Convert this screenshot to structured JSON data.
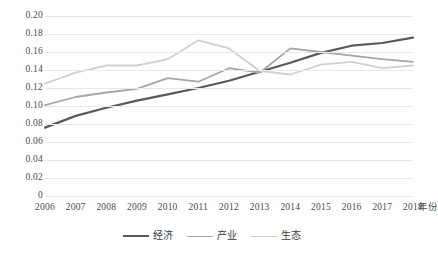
{
  "chart_data": {
    "type": "line",
    "title": "",
    "xlabel": "年份",
    "ylabel": "",
    "categories": [
      "2006",
      "2007",
      "2008",
      "2009",
      "2010",
      "2011",
      "2012",
      "2013",
      "2014",
      "2015",
      "2016",
      "2017",
      "2018"
    ],
    "ylim": [
      0,
      0.2
    ],
    "ytick_labels": [
      "0.20",
      "0.18",
      "0.16",
      "0.14",
      "0.12",
      "0.10",
      "0.08",
      "0.06",
      "0.04",
      "0.02",
      "0"
    ],
    "ytick_values": [
      0.2,
      0.18,
      0.16,
      0.14,
      0.12,
      0.1,
      0.08,
      0.06,
      0.04,
      0.02,
      0
    ],
    "grid": true,
    "legend_position": "bottom",
    "series": [
      {
        "name": "经济",
        "color": "#595959",
        "width": 2.2,
        "values": [
          0.076,
          0.089,
          0.098,
          0.106,
          0.113,
          0.12,
          0.128,
          0.138,
          0.148,
          0.159,
          0.167,
          0.17,
          0.176
        ]
      },
      {
        "name": "产业",
        "color": "#a6a6a6",
        "width": 1.8,
        "values": [
          0.101,
          0.11,
          0.115,
          0.119,
          0.131,
          0.127,
          0.142,
          0.137,
          0.164,
          0.16,
          0.156,
          0.152,
          0.149
        ]
      },
      {
        "name": "生态",
        "color": "#d0d0d0",
        "width": 1.8,
        "values": [
          0.125,
          0.137,
          0.145,
          0.145,
          0.152,
          0.173,
          0.164,
          0.139,
          0.135,
          0.146,
          0.149,
          0.142,
          0.145
        ]
      }
    ]
  }
}
